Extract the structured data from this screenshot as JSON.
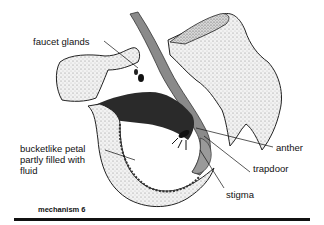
{
  "diagram": {
    "labels": {
      "faucet_glands": "faucet glands",
      "bucket_petal_line1": "bucketlike petal",
      "bucket_petal_line2": "partly filled with",
      "bucket_petal_line3": "fluid",
      "anther": "anther",
      "trapdoor": "trapdoor",
      "stigma": "stigma"
    },
    "caption": "mechanism 6",
    "colors": {
      "ink": "#111111",
      "petal_fill": "#e8e8e8",
      "column_gray": "#8a8a8a",
      "dark_fill": "#2a2a2a",
      "background": "#ffffff"
    }
  }
}
